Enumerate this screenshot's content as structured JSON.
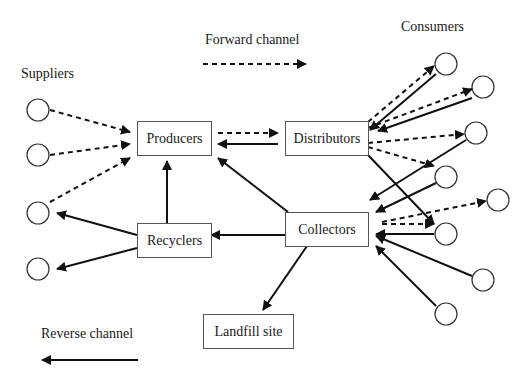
{
  "diagram": {
    "labels": {
      "suppliers": "Suppliers",
      "consumers": "Consumers",
      "forward_channel": "Forward channel",
      "reverse_channel": "Reverse channel"
    },
    "nodes": {
      "producers": "Producers",
      "distributors": "Distributors",
      "recyclers": "Recyclers",
      "collectors": "Collectors",
      "landfill": "Landfill site"
    },
    "suppliers_count": 4,
    "consumers_count": 8,
    "legend": [
      {
        "label": "Forward channel",
        "style": "dashed"
      },
      {
        "label": "Reverse channel",
        "style": "solid"
      }
    ],
    "edges": [
      {
        "from": "Supplier 1",
        "to": "Producers",
        "type": "forward"
      },
      {
        "from": "Supplier 2",
        "to": "Producers",
        "type": "forward"
      },
      {
        "from": "Supplier 3",
        "to": "Producers",
        "type": "forward"
      },
      {
        "from": "Producers",
        "to": "Distributors",
        "type": "forward"
      },
      {
        "from": "Distributors",
        "to": "Producers",
        "type": "reverse"
      },
      {
        "from": "Distributors",
        "to": "Consumers",
        "type": "forward"
      },
      {
        "from": "Consumers",
        "to": "Distributors",
        "type": "reverse"
      },
      {
        "from": "Consumers",
        "to": "Collectors",
        "type": "reverse"
      },
      {
        "from": "Collectors",
        "to": "Consumers",
        "type": "forward"
      },
      {
        "from": "Collectors",
        "to": "Producers",
        "type": "reverse"
      },
      {
        "from": "Collectors",
        "to": "Recyclers",
        "type": "reverse"
      },
      {
        "from": "Collectors",
        "to": "Landfill site",
        "type": "reverse"
      },
      {
        "from": "Recyclers",
        "to": "Producers",
        "type": "reverse"
      },
      {
        "from": "Recyclers",
        "to": "Supplier 3",
        "type": "reverse"
      },
      {
        "from": "Recyclers",
        "to": "Supplier 4",
        "type": "reverse"
      }
    ]
  }
}
